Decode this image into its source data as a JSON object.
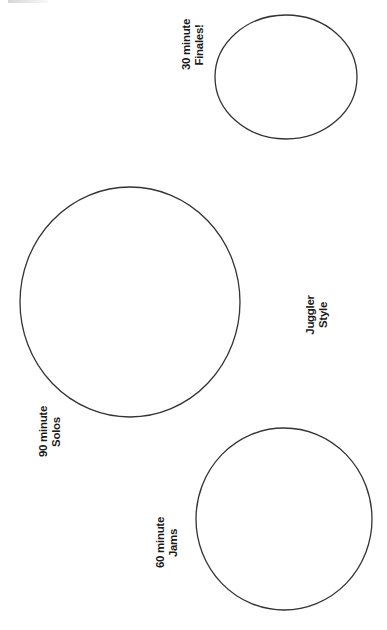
{
  "diagram": {
    "type": "circle-labels",
    "stroke_color": "#333333",
    "background": "#ffffff",
    "circles": [
      {
        "id": "finales",
        "cx": 286,
        "cy": 77,
        "rx": 71,
        "ry": 62
      },
      {
        "id": "solos",
        "cx": 130,
        "cy": 302,
        "rx": 110,
        "ry": 115
      },
      {
        "id": "jams",
        "cx": 284,
        "cy": 519,
        "rx": 88,
        "ry": 91
      }
    ],
    "labels": {
      "finales": {
        "line1": "30 minute",
        "line2": "Finales!"
      },
      "juggler": {
        "line1": "Juggler",
        "line2": "Style"
      },
      "solos": {
        "line1": "90 minute",
        "line2": "Solos"
      },
      "jams": {
        "line1": "60 minute",
        "line2": "Jams"
      }
    }
  }
}
